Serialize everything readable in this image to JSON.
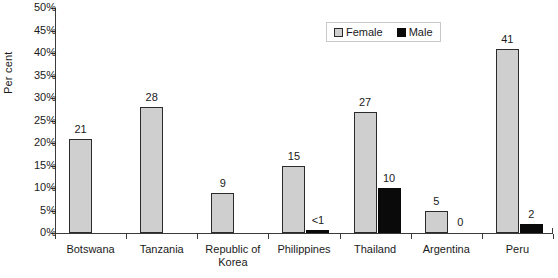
{
  "chart_data": {
    "type": "bar",
    "title": "",
    "xlabel": "",
    "ylabel": "Per cent",
    "ylim": [
      0,
      50
    ],
    "ytick_labels": [
      "0%",
      "5%",
      "10%",
      "15%",
      "20%",
      "25%",
      "30%",
      "35%",
      "40%",
      "45%",
      "50%"
    ],
    "ytick_values": [
      0,
      5,
      10,
      15,
      20,
      25,
      30,
      35,
      40,
      45,
      50
    ],
    "grid": false,
    "legend_position": "top-right",
    "categories": [
      "Botswana",
      "Tanzania",
      "Republic of Korea",
      "Philippines",
      "Thailand",
      "Argentina",
      "Peru"
    ],
    "series": [
      {
        "name": "Female",
        "color": "#cfcfcf",
        "values": [
          21,
          28,
          9,
          15,
          27,
          5,
          41
        ],
        "labels": [
          "21",
          "28",
          "9",
          "15",
          "27",
          "5",
          "41"
        ]
      },
      {
        "name": "Male",
        "color": "#0a0a0a",
        "values": [
          null,
          null,
          null,
          0.5,
          10,
          0,
          2
        ],
        "labels": [
          "",
          "",
          "",
          "<1",
          "10",
          "0",
          "2"
        ]
      }
    ]
  },
  "axes": {
    "y_title": "Per cent"
  },
  "legend": {
    "items": [
      {
        "label": "Female",
        "swatch": "female-swatch"
      },
      {
        "label": "Male",
        "swatch": "male-swatch"
      }
    ]
  },
  "category_labels": [
    {
      "line1": "Botswana",
      "line2": ""
    },
    {
      "line1": "Tanzania",
      "line2": ""
    },
    {
      "line1": "Republic of",
      "line2": "Korea"
    },
    {
      "line1": "Philippines",
      "line2": ""
    },
    {
      "line1": "Thailand",
      "line2": ""
    },
    {
      "line1": "Argentina",
      "line2": ""
    },
    {
      "line1": "Peru",
      "line2": ""
    }
  ]
}
